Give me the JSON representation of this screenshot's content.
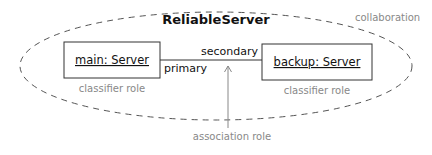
{
  "diagram": {
    "collaboration_name": "ReliableServer",
    "collaboration_label": "collaboration",
    "objects": [
      {
        "name": "main: Server",
        "role_label": "classifier role"
      },
      {
        "name": "backup: Server",
        "role_label": "classifier role"
      }
    ],
    "association": {
      "end_primary": "primary",
      "end_secondary": "secondary",
      "role_label": "association role"
    },
    "colors": {
      "line": "#333333",
      "annotation": "#888888"
    }
  }
}
